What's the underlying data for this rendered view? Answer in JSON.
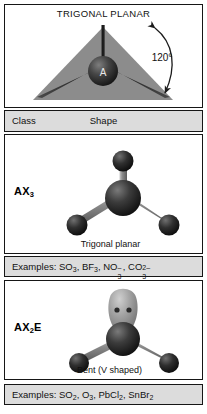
{
  "figure": {
    "title": "TRIGONAL PLANAR",
    "angle_label": "120°",
    "center_atom_label": "A"
  },
  "table": {
    "header": {
      "class_label": "Class",
      "shape_label": "Shape"
    },
    "rows": [
      {
        "class": "AX3",
        "class_base": "AX",
        "class_sub": "3",
        "shape_caption": "Trigonal planar",
        "examples_prefix": "Examples:",
        "examples_full": "Examples: SO3, BF3, NO3-, CO32-",
        "examples": [
          {
            "formula": "SO",
            "sub": "3",
            "charge": ""
          },
          {
            "formula": "BF",
            "sub": "3",
            "charge": ""
          },
          {
            "formula": "NO",
            "sub": "3",
            "charge": "–"
          },
          {
            "formula": "CO",
            "sub": "3",
            "charge": "2–"
          }
        ]
      },
      {
        "class": "AX2E",
        "class_base": "AX",
        "class_sub": "2",
        "class_tail": "E",
        "shape_caption": "Bent (V shaped)",
        "examples_prefix": "Examples:",
        "examples_full": "Examples: SO2, O3, PbCl2, SnBr2",
        "examples": [
          {
            "formula": "SO",
            "sub": "2",
            "charge": ""
          },
          {
            "formula": "O",
            "sub": "3",
            "charge": ""
          },
          {
            "formula": "PbCl",
            "sub": "2",
            "charge": ""
          },
          {
            "formula": "SnBr",
            "sub": "2",
            "charge": ""
          }
        ]
      }
    ]
  },
  "colors": {
    "border": "#161616",
    "band_background": "#dcdcdc",
    "plane_fill": "#8c8c8c",
    "atom_dark": "#2a2a2a",
    "bond_gray": "#9a9a9a",
    "lone_pair_lobe": "#9d9d9d",
    "page_background": "#ffffff"
  }
}
